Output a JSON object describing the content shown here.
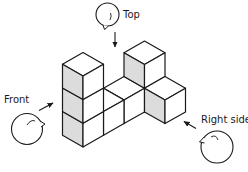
{
  "figure": {
    "colors": {
      "line": "#1a1a1a",
      "face_top": "#ffffff",
      "face_front": "#ffffff",
      "face_left_shaded": "#dcdcdc",
      "background": "#ffffff"
    },
    "cubes": [
      {
        "i": 0,
        "j": 0,
        "k": 0
      },
      {
        "i": 0,
        "j": 0,
        "k": 1
      },
      {
        "i": 0,
        "j": 0,
        "k": 2
      },
      {
        "i": 1,
        "j": 0,
        "k": 0
      },
      {
        "i": 2,
        "j": 0,
        "k": 0
      },
      {
        "i": 3,
        "j": 0,
        "k": 0
      },
      {
        "i": 3,
        "j": 0,
        "k": 1
      },
      {
        "i": 3,
        "j": -1,
        "k": 0
      }
    ],
    "viewers": {
      "top": {
        "label": "Top",
        "icon": "viewer-eye-icon"
      },
      "front": {
        "label": "Front",
        "icon": "viewer-eye-icon"
      },
      "right": {
        "label": "Right side",
        "icon": "viewer-eye-icon"
      }
    }
  }
}
